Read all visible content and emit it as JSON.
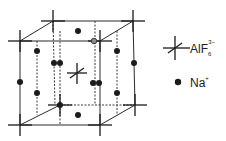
{
  "figure": {
    "type": "crystal-structure-unit-cell"
  },
  "legend": {
    "items": [
      {
        "symbol": "cross",
        "label": "AlF",
        "subscript": "6",
        "superscript": "3−"
      },
      {
        "symbol": "dot",
        "label": "Na",
        "superscript": "+"
      }
    ]
  },
  "colors": {
    "line": "#2a2a2a",
    "dot": "#1c1c1c",
    "background": "#ffffff"
  }
}
